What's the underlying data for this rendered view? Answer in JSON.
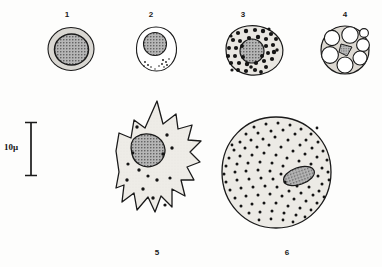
{
  "figure": {
    "background_color": "#fdfdfc",
    "ink_color": "#1a1a1a",
    "scale_bar": {
      "label": "10μ",
      "value": 10,
      "unit": "μ",
      "orientation": "vertical",
      "length_px": 54,
      "serif_caps": true
    },
    "panels": [
      {
        "number": "1",
        "name": "small-round-cell",
        "description": "Small round cell with thin pale cytoplasm ring and large stippled nucleus",
        "shape": "round",
        "cytoplasm_fill": "#d9d7d2",
        "nucleus_fill": "#9a9a9a",
        "nucleus_shape": "round",
        "granules": 0,
        "vacuoles": 0
      },
      {
        "number": "2",
        "name": "egg-shaped-cell",
        "description": "Egg shaped cell, clear cytoplasm, round stippled nucleus at top, few small granules at base",
        "shape": "ovoid",
        "cytoplasm_fill": "#ffffff",
        "nucleus_fill": "#bdbdbd",
        "nucleus_shape": "round",
        "granules": 12,
        "vacuoles": 0
      },
      {
        "number": "3",
        "name": "granular-cell",
        "description": "Irregular oval cell densely packed with large black granules around a stippled nucleus",
        "shape": "irregular-oval",
        "cytoplasm_fill": "#e8e6e1",
        "nucleus_fill": "#a5a5a5",
        "nucleus_shape": "round",
        "granules": 58,
        "vacuoles": 0
      },
      {
        "number": "4",
        "name": "vacuolated-cell",
        "description": "Round cell filled with large clear vacuoles and a small stippled nucleus squeezed in the centre",
        "shape": "round",
        "cytoplasm_fill": "#ddd9d2",
        "nucleus_fill": "#8f8f8f",
        "nucleus_shape": "triangular",
        "granules": 0,
        "vacuoles": 7
      },
      {
        "number": "5",
        "name": "spiny-stellate-cell",
        "description": "Large elongated cell with sharp spiny projections, pale cytoplasm, scattered granules and a large stippled nucleus",
        "shape": "spiny-elongate",
        "cytoplasm_fill": "#e6e4df",
        "nucleus_fill": "#9d9d9d",
        "nucleus_shape": "rounded-triangular",
        "granules": 14,
        "vacuoles": 0
      },
      {
        "number": "6",
        "name": "large-granular-round-cell",
        "description": "Large round cell densely filled with fine granules, oval stippled nucleus offset to the right",
        "shape": "round",
        "cytoplasm_fill": "#eceae5",
        "nucleus_fill": "#a0a0a0",
        "nucleus_shape": "oval",
        "granules": 340,
        "vacuoles": 0
      }
    ]
  }
}
